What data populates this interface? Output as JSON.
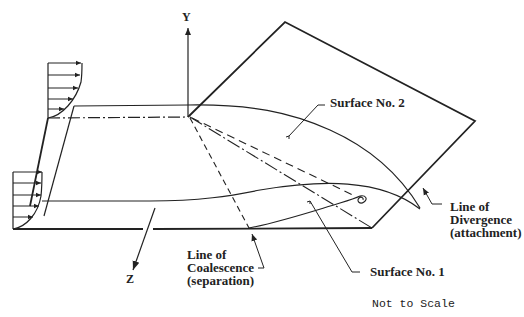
{
  "diagram": {
    "type": "3D flow separation schematic",
    "axes": {
      "y_label": "Y",
      "z_label": "Z"
    },
    "labels": {
      "surface2": "Surface No. 2",
      "surface1": "Surface No. 1",
      "divergence_line1": "Line of",
      "divergence_line2": "Divergence",
      "divergence_line3": "(attachment)",
      "coalescence_line1": "Line of",
      "coalescence_line2": "Coalescence",
      "coalescence_line3": "(separation)",
      "scale_note": "Not to Scale"
    },
    "colors": {
      "stroke": "#222222",
      "background": "#ffffff"
    }
  }
}
